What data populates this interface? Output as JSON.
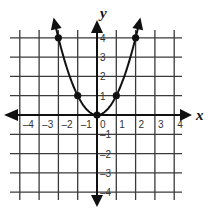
{
  "chart_data": {
    "type": "line",
    "title": "",
    "xlabel": "x",
    "ylabel": "y",
    "xlim": [
      -4,
      4
    ],
    "ylim": [
      -4,
      4
    ],
    "grid": true,
    "x_ticks": [
      -4,
      -3,
      -2,
      -1,
      0,
      1,
      2,
      3,
      4
    ],
    "y_ticks": [
      -4,
      -3,
      -2,
      -1,
      1,
      2,
      3,
      4
    ],
    "x_tick_labels": [
      "–4",
      "–3",
      "–2",
      "–1",
      "0",
      "1",
      "2",
      "3",
      "4"
    ],
    "y_tick_labels": [
      "–4",
      "–3",
      "–2",
      "–1",
      "1",
      "2",
      "3",
      "4"
    ],
    "series": [
      {
        "name": "y = x²",
        "kind": "parabola",
        "both_ends_arrowed": true,
        "marked_points": [
          {
            "x": -2,
            "y": 4
          },
          {
            "x": -1,
            "y": 1
          },
          {
            "x": 0,
            "y": 0
          },
          {
            "x": 1,
            "y": 1
          },
          {
            "x": 2,
            "y": 4
          }
        ]
      }
    ],
    "colors": {
      "line": "#111111",
      "grid": "#3a3a3a",
      "background": "#ffffff"
    }
  },
  "labels": {
    "x_axis": "x",
    "y_axis": "y"
  }
}
